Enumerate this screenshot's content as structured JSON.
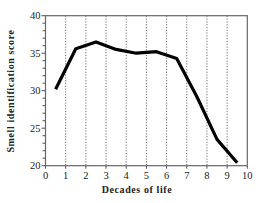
{
  "chart_data": {
    "type": "line",
    "title": "",
    "xlabel": "Decades of life",
    "ylabel": "Smell identification score",
    "xlim": [
      0,
      10
    ],
    "ylim": [
      20,
      40
    ],
    "x_ticks": [
      0,
      1,
      2,
      3,
      4,
      5,
      6,
      7,
      8,
      9,
      10
    ],
    "y_ticks": [
      20,
      25,
      30,
      35,
      40
    ],
    "y_minor_tick_step": 1,
    "grid": "vertical dotted lines at x = 1..9",
    "legend": null,
    "series": [
      {
        "name": "Smell identification score",
        "x": [
          0.5,
          1.5,
          2.5,
          3.5,
          4.5,
          5.5,
          6.5,
          7.5,
          8.5,
          9.5
        ],
        "values": [
          30.2,
          35.6,
          36.5,
          35.5,
          35.0,
          35.2,
          34.3,
          29.2,
          23.5,
          20.4
        ],
        "color": "#000000"
      }
    ]
  },
  "colors": {
    "line": "#000000",
    "axis": "#555555",
    "grid": "#444444",
    "background": "#ffffff"
  }
}
